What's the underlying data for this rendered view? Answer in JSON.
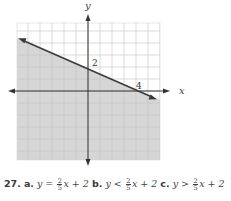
{
  "chart_data": {
    "type": "line",
    "title": "",
    "xlabel": "x",
    "ylabel": "y",
    "xlim": [
      -6,
      6
    ],
    "ylim": [
      -5.7,
      5.7
    ],
    "grid": true,
    "series": [
      {
        "name": "boundary line",
        "style": "solid",
        "x": [
          -6,
          5
        ],
        "y": [
          4.4,
          -0.2
        ],
        "passes_through": [
          [
            0,
            2
          ],
          [
            4,
            0
          ]
        ]
      }
    ],
    "shaded_region": "below line",
    "annotations": [
      {
        "text": "2",
        "at": [
          0,
          2
        ]
      },
      {
        "text": "4",
        "at": [
          4,
          0
        ]
      }
    ]
  },
  "labels": {
    "x_axis": "x",
    "y_axis": "y",
    "y_intercept": "2",
    "x_intercept": "4"
  },
  "caption": {
    "number": "27.",
    "parts": [
      {
        "label": "a.",
        "lhs": "y",
        "op": "=",
        "frac_num": "2",
        "frac_den": "5",
        "rhs": "x + 2"
      },
      {
        "label": "b.",
        "lhs": "y",
        "op": "<",
        "frac_num": "2",
        "frac_den": "5",
        "rhs": "x + 2"
      },
      {
        "label": "c.",
        "lhs": "y",
        "op": ">",
        "frac_num": "2",
        "frac_den": "5",
        "rhs": "x + 2"
      }
    ]
  },
  "colors": {
    "shade": "#d6d6d6",
    "grid": "#c4c4c4",
    "axis": "#333333",
    "line": "#3a3a3a"
  }
}
